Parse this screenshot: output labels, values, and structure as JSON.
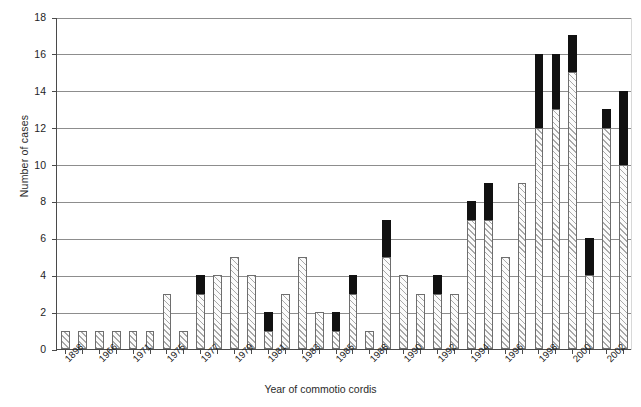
{
  "chart_data": {
    "type": "bar",
    "title": "",
    "xlabel": "Year of commotio cordis",
    "ylabel": "Number of cases",
    "ylim": [
      0,
      18
    ],
    "ytick_step": 2,
    "yticks": [
      0,
      2,
      4,
      6,
      8,
      10,
      12,
      14,
      16,
      18
    ],
    "grid": "horizontal",
    "legend": "none",
    "stacked": true,
    "series": [
      {
        "name": "survived",
        "style": "hatched"
      },
      {
        "name": "died",
        "style": "solid-black"
      }
    ],
    "categories": [
      "1898",
      "1966",
      "1971",
      "1975",
      "1977",
      "1979",
      "1981",
      "1983",
      "1985",
      "1988",
      "1990",
      "1992",
      "1994",
      "1996",
      "1998",
      "2000",
      "2002"
    ],
    "tick_labels_visible_every": 2,
    "x": [
      "1898",
      "1965",
      "1966",
      "1970",
      "1971",
      "1974",
      "1975",
      "1976",
      "1977",
      "1978",
      "1979",
      "1980",
      "1981",
      "1982",
      "1983",
      "1984",
      "1985",
      "1986",
      "1988",
      "1989",
      "1990",
      "1991",
      "1992",
      "1993",
      "1994",
      "1995",
      "1996",
      "1997",
      "1998",
      "1999",
      "2000",
      "2001",
      "2002",
      "2003"
    ],
    "bars": [
      {
        "label": "1898",
        "hatched": 1,
        "solid": 0,
        "total": 1
      },
      {
        "label": "1965",
        "hatched": 1,
        "solid": 0,
        "total": 1
      },
      {
        "label": "1966",
        "hatched": 1,
        "solid": 0,
        "total": 1
      },
      {
        "label": "1970",
        "hatched": 1,
        "solid": 0,
        "total": 1
      },
      {
        "label": "1971",
        "hatched": 1,
        "solid": 0,
        "total": 1
      },
      {
        "label": "1974",
        "hatched": 1,
        "solid": 0,
        "total": 1
      },
      {
        "label": "1975",
        "hatched": 3,
        "solid": 0,
        "total": 3
      },
      {
        "label": "1976",
        "hatched": 1,
        "solid": 0,
        "total": 1
      },
      {
        "label": "1977",
        "hatched": 3,
        "solid": 1,
        "total": 4
      },
      {
        "label": "1978",
        "hatched": 4,
        "solid": 0,
        "total": 4
      },
      {
        "label": "1979",
        "hatched": 5,
        "solid": 0,
        "total": 5
      },
      {
        "label": "1980",
        "hatched": 4,
        "solid": 0,
        "total": 4
      },
      {
        "label": "1981",
        "hatched": 1,
        "solid": 1,
        "total": 2
      },
      {
        "label": "1982",
        "hatched": 3,
        "solid": 0,
        "total": 3
      },
      {
        "label": "1983",
        "hatched": 5,
        "solid": 0,
        "total": 5
      },
      {
        "label": "1984",
        "hatched": 2,
        "solid": 0,
        "total": 2
      },
      {
        "label": "1985",
        "hatched": 1,
        "solid": 1,
        "total": 2
      },
      {
        "label": "1986",
        "hatched": 3,
        "solid": 1,
        "total": 4
      },
      {
        "label": "1988",
        "hatched": 1,
        "solid": 0,
        "total": 1
      },
      {
        "label": "1989",
        "hatched": 5,
        "solid": 2,
        "total": 7
      },
      {
        "label": "1990",
        "hatched": 4,
        "solid": 0,
        "total": 4
      },
      {
        "label": "1991",
        "hatched": 3,
        "solid": 0,
        "total": 3
      },
      {
        "label": "1992",
        "hatched": 3,
        "solid": 1,
        "total": 4
      },
      {
        "label": "1993",
        "hatched": 3,
        "solid": 0,
        "total": 3
      },
      {
        "label": "1994",
        "hatched": 7,
        "solid": 1,
        "total": 8
      },
      {
        "label": "1995",
        "hatched": 7,
        "solid": 2,
        "total": 9
      },
      {
        "label": "1996",
        "hatched": 5,
        "solid": 0,
        "total": 5
      },
      {
        "label": "1997",
        "hatched": 9,
        "solid": 0,
        "total": 9
      },
      {
        "label": "1998",
        "hatched": 12,
        "solid": 4,
        "total": 16
      },
      {
        "label": "1999",
        "hatched": 13,
        "solid": 3,
        "total": 16
      },
      {
        "label": "2000",
        "hatched": 15,
        "solid": 2,
        "total": 17
      },
      {
        "label": "2001",
        "hatched": 4,
        "solid": 2,
        "total": 6
      },
      {
        "label": "2002",
        "hatched": 12,
        "solid": 1,
        "total": 13
      },
      {
        "label": "2003",
        "hatched": 10,
        "solid": 4,
        "total": 14
      }
    ]
  },
  "colors": {
    "hatch_line": "#a9a9a9",
    "bar_outline": "#6e6e6e",
    "solid_fill": "#111111",
    "gridline": "#8d8d8d",
    "axis": "#4a4a4a",
    "text": "#1e1e1e",
    "background": "#ffffff"
  }
}
